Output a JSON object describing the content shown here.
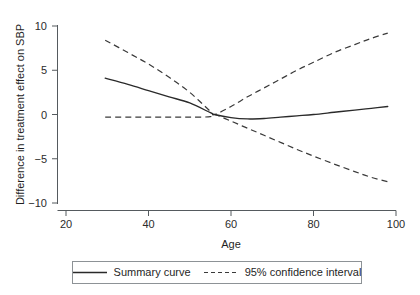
{
  "chart_data": {
    "type": "line",
    "title": "",
    "xlabel": "Age",
    "ylabel": "Difference in treatment effect on SBP",
    "xlim": [
      20,
      100
    ],
    "ylim": [
      -10,
      10
    ],
    "xticks": [
      20,
      40,
      60,
      80,
      100
    ],
    "yticks": [
      10,
      5,
      0,
      -5,
      -10
    ],
    "xtick_labels": [
      "20",
      "40",
      "60",
      "80",
      "100"
    ],
    "ytick_labels": [
      "10",
      "5",
      "0",
      "−5",
      "−10"
    ],
    "grid": false,
    "legend_position": "below-axes",
    "series": [
      {
        "name": "Summary curve",
        "style": "solid",
        "color": "#2a2a2a",
        "x": [
          29.5,
          35,
          40,
          45,
          50,
          55,
          56,
          60,
          64,
          68,
          72,
          76,
          80,
          85,
          90,
          94,
          98
        ],
        "y": [
          4.1,
          3.4,
          2.7,
          2.0,
          1.3,
          0.2,
          0.0,
          -0.35,
          -0.5,
          -0.45,
          -0.3,
          -0.15,
          0.0,
          0.25,
          0.5,
          0.7,
          0.9
        ]
      },
      {
        "name": "95% confidence interval (upper)",
        "style": "dashed",
        "color": "#3a3a3a",
        "x": [
          29.5,
          35,
          40,
          45,
          50,
          55,
          56,
          60,
          64,
          68,
          72,
          76,
          80,
          85,
          90,
          94,
          98
        ],
        "y": [
          8.4,
          7.0,
          5.7,
          4.2,
          2.5,
          0.35,
          0.0,
          0.9,
          2.0,
          3.0,
          4.0,
          5.0,
          5.9,
          7.0,
          7.9,
          8.6,
          9.2
        ]
      },
      {
        "name": "95% confidence interval (lower)",
        "style": "dashed",
        "color": "#3a3a3a",
        "x": [
          29.5,
          35,
          40,
          45,
          50,
          55,
          56,
          60,
          64,
          68,
          72,
          76,
          80,
          85,
          90,
          94,
          98
        ],
        "y": [
          -0.3,
          -0.3,
          -0.3,
          -0.3,
          -0.3,
          -0.25,
          0.0,
          -0.75,
          -1.55,
          -2.35,
          -3.15,
          -3.95,
          -4.7,
          -5.6,
          -6.45,
          -7.1,
          -7.6
        ]
      }
    ],
    "crossing_point": {
      "x": 56,
      "y": 0
    },
    "legend": [
      {
        "label": "Summary curve",
        "style": "solid"
      },
      {
        "label": "95% confidence interval",
        "style": "dashed"
      }
    ]
  }
}
